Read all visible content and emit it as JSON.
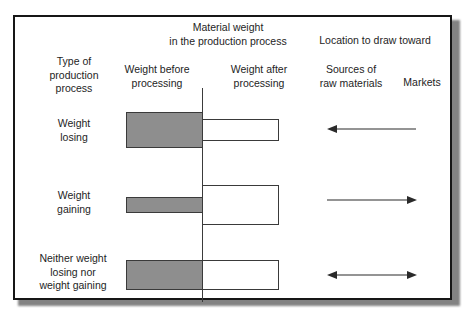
{
  "figure": {
    "group_headers": [
      {
        "id": "material-weight",
        "label": "Material weight\nin the production process"
      },
      {
        "id": "location",
        "label": "Location to draw toward"
      }
    ],
    "column_headers": [
      {
        "id": "type-of-production-process",
        "label": "Type of\nproduction\nprocess"
      },
      {
        "id": "weight-before-processing",
        "label": "Weight before\nprocessing"
      },
      {
        "id": "weight-after-processing",
        "label": "Weight after\nprocessing"
      },
      {
        "id": "sources-of-raw-materials",
        "label": "Sources of\nraw materials"
      },
      {
        "id": "markets",
        "label": "Markets"
      }
    ],
    "rows": [
      {
        "id": "weight-losing",
        "label": "Weight\nlosing",
        "weight_before": {
          "relative_size": "large",
          "height_px": 36,
          "fill": "#8e8e8e"
        },
        "weight_after": {
          "relative_size": "small",
          "height_px": 22,
          "fill": "#ffffff"
        },
        "arrow": {
          "direction": "left",
          "points_toward": "Sources of raw materials"
        }
      },
      {
        "id": "weight-gaining",
        "label": "Weight\ngaining",
        "weight_before": {
          "relative_size": "small",
          "height_px": 16,
          "fill": "#8e8e8e"
        },
        "weight_after": {
          "relative_size": "large",
          "height_px": 40,
          "fill": "#ffffff"
        },
        "arrow": {
          "direction": "right",
          "points_toward": "Markets"
        }
      },
      {
        "id": "neither-losing-nor-gaining",
        "label": "Neither weight\nlosing nor\nweight gaining",
        "weight_before": {
          "relative_size": "medium",
          "height_px": 30,
          "fill": "#8e8e8e"
        },
        "weight_after": {
          "relative_size": "medium",
          "height_px": 30,
          "fill": "#ffffff"
        },
        "arrow": {
          "direction": "both",
          "points_toward": "Sources of raw materials and Markets"
        }
      }
    ],
    "colors": {
      "bar_before_fill": "#8e8e8e",
      "bar_after_fill": "#ffffff",
      "bar_stroke": "#3a3a3a",
      "frame_border": "#161616",
      "divider": "#3b3b3b",
      "arrow": "#2a2a2a",
      "text": "#242424",
      "background": "#ffffff"
    }
  }
}
